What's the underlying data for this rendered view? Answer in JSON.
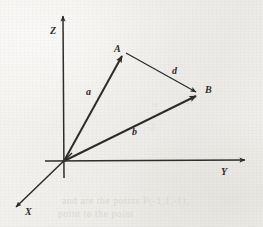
{
  "figure": {
    "kind": "3d-vector-diagram",
    "background_color": "#f2f1ee",
    "ink_color": "#2b2b2b",
    "axes": [
      {
        "name": "Z",
        "label": "Z",
        "direction": "up",
        "origin": [
          64,
          161
        ],
        "tip": [
          63,
          14
        ]
      },
      {
        "name": "Y",
        "label": "Y",
        "direction": "right",
        "origin": [
          64,
          161
        ],
        "tip": [
          248,
          160
        ]
      },
      {
        "name": "X",
        "label": "X",
        "direction": "down-left",
        "origin": [
          64,
          161
        ],
        "tip": [
          13,
          210
        ]
      }
    ],
    "points": [
      {
        "name": "A",
        "label": "A",
        "x": 124,
        "y": 52
      },
      {
        "name": "B",
        "label": "B",
        "x": 199,
        "y": 94
      }
    ],
    "vectors": [
      {
        "name": "a",
        "label": "a",
        "from": "origin",
        "to": "A",
        "from_xy": [
          64,
          161
        ],
        "to_xy": [
          124,
          52
        ],
        "label_xy": [
          86,
          87
        ]
      },
      {
        "name": "b",
        "label": "b",
        "from": "origin",
        "to": "B",
        "from_xy": [
          64,
          161
        ],
        "to_xy": [
          199,
          94
        ],
        "label_xy": [
          132,
          127
        ]
      },
      {
        "name": "d",
        "label": "d",
        "from": "A",
        "to": "B",
        "from_xy": [
          124,
          52
        ],
        "to_xy": [
          199,
          94
        ],
        "label_xy": [
          172,
          66
        ]
      }
    ],
    "labels": {
      "z_axis": "Z",
      "y_axis": "Y",
      "x_axis": "X",
      "point_a": "A",
      "point_b": "B",
      "vector_a": "a",
      "vector_b": "b",
      "vector_d": "d"
    }
  },
  "bleed_through": {
    "line1": "and  are  the  points  P(-1,1,-1),",
    "line2": "point to the point",
    "math1": "+",
    "math2": "=",
    "math3": "2"
  }
}
